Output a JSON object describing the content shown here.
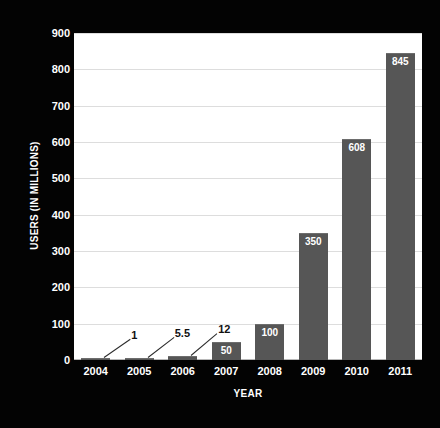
{
  "chart_data": {
    "type": "bar",
    "title": "",
    "xlabel": "YEAR",
    "ylabel": "USERS (IN MILLIONS)",
    "categories": [
      "2004",
      "2005",
      "2006",
      "2007",
      "2008",
      "2009",
      "2010",
      "2011"
    ],
    "values": [
      1,
      5.5,
      12,
      50,
      100,
      350,
      608,
      845
    ],
    "value_labels": [
      "1",
      "5.5",
      "12",
      "50",
      "100",
      "350",
      "608",
      "845"
    ],
    "ylim": [
      0,
      900
    ],
    "ytick_labels": [
      "0",
      "100",
      "200",
      "300",
      "400",
      "500",
      "600",
      "700",
      "800",
      "900"
    ],
    "ytick_values": [
      0,
      100,
      200,
      300,
      400,
      500,
      600,
      700,
      800,
      900
    ],
    "grid": true,
    "legend": "none",
    "series_color": "#565656",
    "plot_background": "#ffffff",
    "figure_background": "#030303",
    "axis_text_color": "#ffffff",
    "gridline_color": "#dddddd"
  }
}
